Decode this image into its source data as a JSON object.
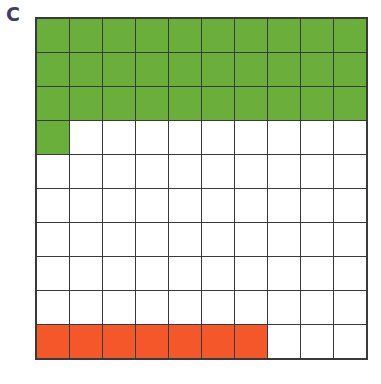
{
  "label": "C",
  "grid": {
    "rows": 10,
    "cols": 10,
    "green_count": 31,
    "red_count": 7,
    "red_row": 9,
    "colors": {
      "green": "#6aaf3c",
      "red": "#f4572a",
      "empty": "#ffffff",
      "line": "#3a3a3a"
    }
  }
}
